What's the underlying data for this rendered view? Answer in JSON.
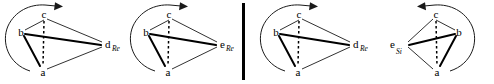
{
  "figure": {
    "type": "stereochemistry-tetrahedron-diagram-set",
    "background_color": "#ffffff",
    "line_color": "#1a1a1a",
    "width": 494,
    "height": 84,
    "divider": {
      "label": "vertical-rule",
      "x": 243,
      "y_top": 3,
      "y_bottom": 80,
      "thickness": 3,
      "color": "#000000"
    },
    "panels": [
      {
        "id": "panel-1",
        "mirrored": false,
        "apex_label": "c",
        "left_label": "b",
        "bottom_label": "a",
        "right_label": "d",
        "right_subscript": "Re",
        "arrow_direction": "clockwise",
        "arrow_side": "left",
        "arrowhead_points": "right",
        "vertices": {
          "c": [
            44,
            16
          ],
          "b": [
            21,
            33
          ],
          "a": [
            43,
            72
          ],
          "d": [
            106,
            44
          ]
        },
        "bold_edges": [
          [
            "b",
            "d"
          ],
          [
            "b",
            "a"
          ]
        ],
        "thin_edges": [
          [
            "c",
            "b"
          ],
          [
            "c",
            "d"
          ],
          [
            "a",
            "d"
          ]
        ],
        "dashed_edges": [
          [
            "c",
            "a"
          ]
        ]
      },
      {
        "id": "panel-2",
        "mirrored": false,
        "apex_label": "c",
        "left_label": "b",
        "bottom_label": "a",
        "right_label": "e",
        "right_subscript": "Re",
        "arrow_direction": "clockwise",
        "arrow_side": "left",
        "arrowhead_points": "right",
        "vertices": {
          "c": [
            169,
            16
          ],
          "b": [
            146,
            33
          ],
          "a": [
            168,
            72
          ],
          "d": [
            221,
            44
          ]
        },
        "bold_edges": [
          [
            "b",
            "d"
          ],
          [
            "b",
            "a"
          ]
        ],
        "thin_edges": [
          [
            "c",
            "b"
          ],
          [
            "c",
            "d"
          ],
          [
            "a",
            "d"
          ]
        ],
        "dashed_edges": [
          [
            "c",
            "a"
          ]
        ]
      },
      {
        "id": "panel-3",
        "mirrored": false,
        "apex_label": "c",
        "left_label": "b",
        "bottom_label": "a",
        "right_label": "d",
        "right_subscript": "Re",
        "arrow_direction": "clockwise",
        "arrow_side": "left",
        "arrowhead_points": "right",
        "vertices": {
          "c": [
            299,
            16
          ],
          "b": [
            276,
            33
          ],
          "a": [
            298,
            72
          ],
          "d": [
            354,
            44
          ]
        },
        "bold_edges": [
          [
            "b",
            "d"
          ],
          [
            "b",
            "a"
          ]
        ],
        "thin_edges": [
          [
            "c",
            "b"
          ],
          [
            "c",
            "d"
          ],
          [
            "a",
            "d"
          ]
        ],
        "dashed_edges": [
          [
            "c",
            "a"
          ]
        ]
      },
      {
        "id": "panel-4",
        "mirrored": true,
        "apex_label": "c",
        "left_label": "e",
        "left_subscript": "Si",
        "bottom_label": "a",
        "right_label": "b",
        "arrow_direction": "counterclockwise",
        "arrow_side": "right",
        "arrowhead_points": "left",
        "vertices": {
          "c": [
            436,
            16
          ],
          "b": [
            459,
            33
          ],
          "a": [
            437,
            72
          ],
          "d": [
            404,
            44
          ]
        },
        "bold_edges": [
          [
            "b",
            "d"
          ],
          [
            "b",
            "a"
          ]
        ],
        "thin_edges": [
          [
            "c",
            "b"
          ],
          [
            "c",
            "d"
          ],
          [
            "a",
            "d"
          ]
        ],
        "dashed_edges": [
          [
            "c",
            "a"
          ]
        ]
      }
    ]
  }
}
